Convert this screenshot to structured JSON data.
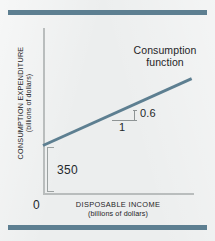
{
  "figure": {
    "background_color": "#eceeee",
    "rule_color": "#5d7f91",
    "axis_color": "#b9bdbd",
    "line_color": "#5d7f91",
    "text_color": "#1f2426"
  },
  "chart_data": {
    "type": "line",
    "title": "",
    "xlabel": "DISPOSABLE INCOME",
    "xlabel_units": "(billions of dollars)",
    "ylabel": "CONSUMPTION EXPENDITURE",
    "ylabel_units": "(billions of dollars)",
    "origin_label": "0",
    "grid": false,
    "legend": "none",
    "series": [
      {
        "name": "Consumption function",
        "type": "line",
        "intercept": 350,
        "slope": 0.6,
        "x": [
          0,
          1000
        ],
        "values": [
          350,
          950
        ]
      }
    ],
    "annotations": [
      {
        "name": "intercept-bracket",
        "label": "350",
        "meaning": "autonomous consumption / vertical intercept"
      },
      {
        "name": "slope-triangle-run",
        "label": "1",
        "meaning": "horizontal run"
      },
      {
        "name": "slope-triangle-rise",
        "label": "0.6",
        "meaning": "vertical rise, marginal propensity to consume"
      },
      {
        "name": "curve-label",
        "label": "Consumption function",
        "meaning": "identifies the plotted line"
      }
    ]
  },
  "labels": {
    "curve_line1": "Consumption",
    "curve_line2": "function",
    "rise": "0.6",
    "run": "1",
    "intercept": "350",
    "origin": "0",
    "x_axis_main": "DISPOSABLE INCOME",
    "x_axis_sub": "(billions of dollars)",
    "y_axis_main": "CONSUMPTION EXPENDITURE",
    "y_axis_sub": "(billions of dollars)"
  }
}
